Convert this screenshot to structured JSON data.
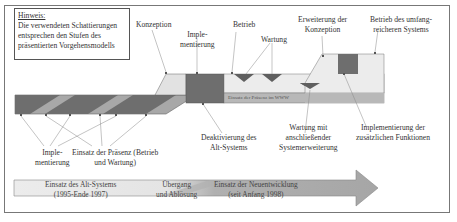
{
  "note": {
    "title": "Hinweis:",
    "lines": [
      "Die verwendeten Schattierungen",
      "entsprechen den Stufen des",
      "präsentierten Vorgehensmodells"
    ]
  },
  "top_labels": {
    "konzeption": "Konzeption",
    "implementierung_1": "Imple-",
    "implementierung_2": "mentierung",
    "betrieb": "Betrieb",
    "wartung": "Wartung",
    "erweiterung_1": "Erweiterung der",
    "erweiterung_2": "Konzeption",
    "betrieb_umfang_1": "Betrieb des umfang-",
    "betrieb_umfang_2": "reicheren Systems"
  },
  "bar_text": "Einsatz der Präsenz im WWW",
  "bottom_labels": {
    "implementierung_1": "Imple-",
    "implementierung_2": "mentierung",
    "einsatz_praesenz_1": "Einsatz der Präsenz (Betrieb",
    "einsatz_praesenz_2": "und Wartung)",
    "deaktivierung_1": "Deaktivierung des",
    "deaktivierung_2": "Alt-Systems",
    "wartung_erweiterung_1": "Wartung mit",
    "wartung_erweiterung_2": "anschließender",
    "wartung_erweiterung_3": "Systemerweiterung",
    "zusatz_funktionen_1": "Implementierung der",
    "zusatz_funktionen_2": "zusätzlichen Funktionen"
  },
  "timeline": {
    "alt_system_1": "Einsatz des Alt-Systems",
    "alt_system_2": "(1995-Ende 1997)",
    "uebergang_1": "Übergang",
    "uebergang_2": "und Ablösung",
    "neu_1": "Einsatz der Neuentwicklung",
    "neu_2": "(seit Anfang 1998)"
  },
  "colors": {
    "dark": "#6e6e6e",
    "medium": "#a8a8a8",
    "light": "#e2e2e2",
    "lighter": "#ececec",
    "arrow_light": "#e6e6e6",
    "arrow_dark": "#9a9a9a"
  }
}
